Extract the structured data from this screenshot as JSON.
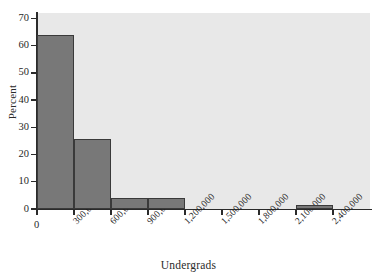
{
  "chart_data": {
    "type": "bar",
    "title": "",
    "subtitle": "",
    "xlabel": "Undergrads",
    "ylabel": "Percent",
    "grid": false,
    "legend": "none",
    "xlim": [
      0,
      2700000
    ],
    "ylim": [
      0,
      72
    ],
    "x_tick_labels": [
      "0",
      "300,000",
      "600,000",
      "900,000",
      "1,200,000",
      "1,500,000",
      "1,800,000",
      "2,100,000",
      "2,400,000"
    ],
    "x_tick_values": [
      0,
      300000,
      600000,
      900000,
      1200000,
      1500000,
      1800000,
      2100000,
      2400000
    ],
    "y_tick_labels": [
      "0",
      "10",
      "20",
      "30",
      "40",
      "50",
      "60",
      "70"
    ],
    "y_tick_values": [
      0,
      10,
      20,
      30,
      40,
      50,
      60,
      70
    ],
    "bin_width": 300000,
    "bins": [
      {
        "label": "0 – 300,000",
        "x0": 0,
        "x1": 300000,
        "value": 64
      },
      {
        "label": "300,000 – 600,000",
        "x0": 300000,
        "x1": 600000,
        "value": 25.8
      },
      {
        "label": "600,000 – 900,000",
        "x0": 600000,
        "x1": 900000,
        "value": 4
      },
      {
        "label": "900,000 – 1,200,000",
        "x0": 900000,
        "x1": 1200000,
        "value": 4
      },
      {
        "label": "1,200,000 – 1,500,000",
        "x0": 1200000,
        "x1": 1500000,
        "value": 0
      },
      {
        "label": "1,500,000 – 1,800,000",
        "x0": 1500000,
        "x1": 1800000,
        "value": 0
      },
      {
        "label": "1,800,000 – 2,100,000",
        "x0": 1800000,
        "x1": 2100000,
        "value": 0
      },
      {
        "label": "2,100,000 – 2,400,000",
        "x0": 2100000,
        "x1": 2400000,
        "value": 1.3
      }
    ],
    "categories": [
      "0–300,000",
      "300,000–600,000",
      "600,000–900,000",
      "900,000–1,200,000",
      "1,200,000–1,500,000",
      "1,500,000–1,800,000",
      "1,800,000–2,100,000",
      "2,100,000–2,400,000"
    ],
    "values": [
      64,
      25.8,
      4,
      4,
      0,
      0,
      0,
      1.3
    ],
    "colors": {
      "bar_fill": "#787878",
      "bar_edge": "#3a3a3a",
      "plot_background": "#e8e8e8",
      "figure_background": "#ffffff",
      "axis": "#2b2b2b",
      "text": "#1f1f1f"
    }
  }
}
